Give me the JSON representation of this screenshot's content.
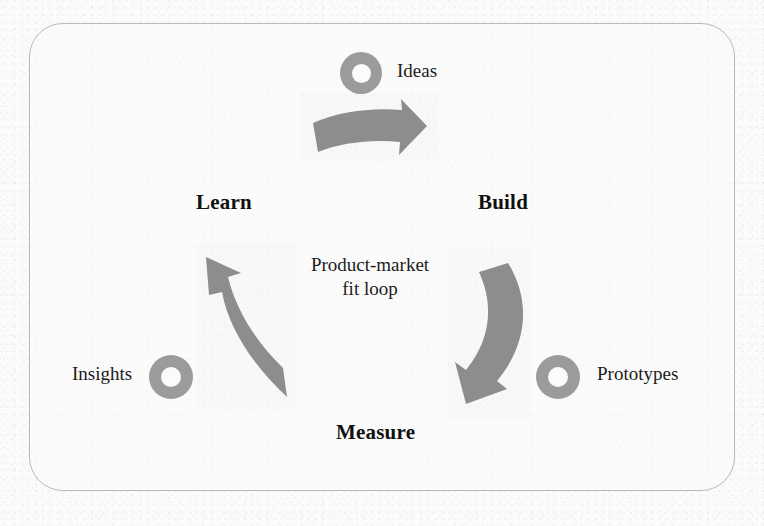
{
  "diagram": {
    "title": "Product-market fit loop",
    "center_caption_line1": "Product-market",
    "center_caption_line2": "fit loop",
    "frame_shape": "rounded-rectangle",
    "colors": {
      "arrow_gray": "#8d8d8d",
      "ring_gray": "#9b9b9b",
      "text_black": "#111111",
      "frame_border": "#b9b9b9",
      "paper": "#fbfbfa"
    },
    "stages": [
      {
        "id": "build",
        "label": "Build",
        "x": 478,
        "y": 190
      },
      {
        "id": "measure",
        "label": "Measure",
        "x": 336,
        "y": 420
      },
      {
        "id": "learn",
        "label": "Learn",
        "x": 196,
        "y": 190
      }
    ],
    "artifacts": [
      {
        "id": "ideas",
        "label": "Ideas",
        "icon": "ring-icon",
        "icon_side": "left",
        "ring_x": 340,
        "ring_y": 52,
        "label_x": 397,
        "label_y": 60
      },
      {
        "id": "prototypes",
        "label": "Prototypes",
        "icon": "ring-icon",
        "icon_side": "left",
        "ring_x": 536,
        "ring_y": 355,
        "label_x": 597,
        "label_y": 363
      },
      {
        "id": "insights",
        "label": "Insights",
        "icon": "ring-icon",
        "icon_side": "right",
        "ring_x": 149,
        "ring_y": 355,
        "label_x": 72,
        "label_y": 363
      }
    ],
    "arrows": [
      {
        "id": "ideas-to-build",
        "from": "Ideas",
        "to": "Build",
        "direction": "right-curved"
      },
      {
        "id": "build-to-prototypes",
        "from": "Build",
        "to": "Measure",
        "direction": "down-left-curved"
      },
      {
        "id": "insights-to-learn",
        "from": "Measure",
        "to": "Learn",
        "direction": "up-left-curved"
      }
    ]
  }
}
